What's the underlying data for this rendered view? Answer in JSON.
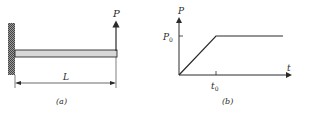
{
  "figure_a": {
    "load_label": "P",
    "length_label": "L",
    "caption": "(a)"
  },
  "figure_b": {
    "y_axis_label": "P",
    "x_axis_label": "t",
    "y_tick_label": "P0",
    "y_tick_base": "P",
    "y_tick_sub": "0",
    "x_tick_base": "t",
    "x_tick_sub": "0",
    "caption": "(b)"
  },
  "colors": {
    "line": "#2a2a2a",
    "wall_hatch": "#555555",
    "beam_fill": "#d8d8d8"
  }
}
